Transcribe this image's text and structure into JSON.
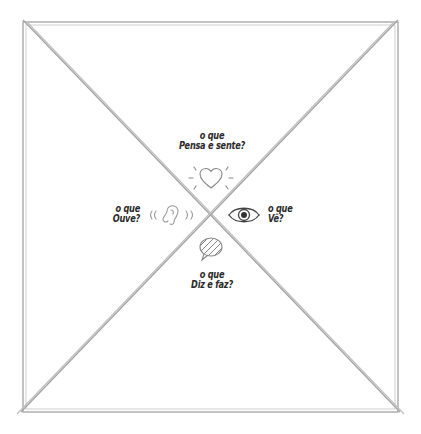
{
  "diagram": {
    "type": "empathy-map",
    "line_color": "#9a9a9a",
    "quadrants": {
      "top": {
        "line1": "o que",
        "line2": "Pensa e sente?",
        "icon": "heart-icon"
      },
      "left": {
        "line1": "o que",
        "line2": "Ouve?",
        "icon": "ear-icon"
      },
      "right": {
        "line1": "o que",
        "line2": "Vê?",
        "icon": "eye-icon"
      },
      "bottom": {
        "line1": "o que",
        "line2": "Diz e faz?",
        "icon": "speech-bubble-icon"
      }
    }
  }
}
